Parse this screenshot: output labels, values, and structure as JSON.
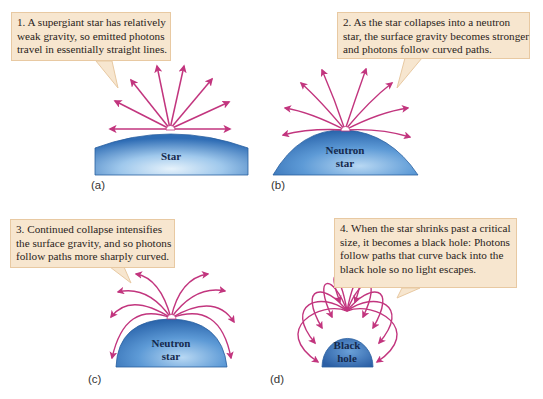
{
  "figure": {
    "colors": {
      "photon_path": "#c2357e",
      "callout_fill": "#f7e6cf",
      "callout_border": "#e8c9a2",
      "star_blue_dark": "#2f6db5",
      "star_blue_light": "#dfeefa",
      "label_text": "#15294d"
    },
    "panels": [
      {
        "id": "a",
        "label": "(a)",
        "callout": {
          "lines": [
            "1. A supergiant star has relatively",
            "weak gravity, so emitted photons",
            "travel in essentially straight lines."
          ]
        },
        "body_label_lines": [
          "Star"
        ],
        "photon_paths": "straight"
      },
      {
        "id": "b",
        "label": "(b)",
        "callout": {
          "lines": [
            "2. As the star collapses into a neutron",
            "star, the surface gravity becomes stronger",
            "and photons follow curved paths."
          ]
        },
        "body_label_lines": [
          "Neutron",
          "star"
        ],
        "photon_paths": "slightly curved"
      },
      {
        "id": "c",
        "label": "(c)",
        "callout": {
          "lines": [
            "3. Continued collapse intensifies",
            "the surface gravity, and so photons",
            "follow paths more sharply curved."
          ]
        },
        "body_label_lines": [
          "Neutron",
          "star"
        ],
        "photon_paths": "sharply curved"
      },
      {
        "id": "d",
        "label": "(d)",
        "callout": {
          "lines": [
            "4. When the star shrinks past a critical",
            "size, it becomes a black hole: Photons",
            "follow paths that curve back into the",
            "black hole so no light escapes."
          ]
        },
        "body_label_lines": [
          "Black",
          "hole"
        ],
        "photon_paths": "curve back into body"
      }
    ]
  }
}
